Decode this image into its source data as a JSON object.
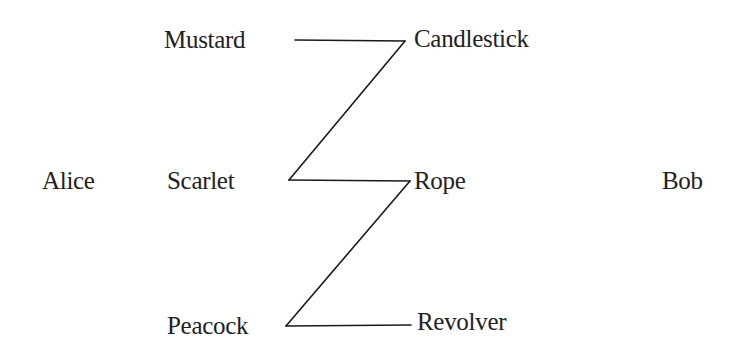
{
  "diagram": {
    "parties": {
      "left": "Alice",
      "right": "Bob"
    },
    "left_column": [
      "Mustard",
      "Scarlet",
      "Peacock"
    ],
    "right_column": [
      "Candlestick",
      "Rope",
      "Revolver"
    ],
    "nodes": [
      {
        "id": "alice",
        "label": "Alice",
        "x": 42,
        "y": 168
      },
      {
        "id": "mustard",
        "label": "Mustard",
        "x": 164,
        "y": 27
      },
      {
        "id": "scarlet",
        "label": "Scarlet",
        "x": 167,
        "y": 168
      },
      {
        "id": "peacock",
        "label": "Peacock",
        "x": 167,
        "y": 313
      },
      {
        "id": "candlestick",
        "label": "Candlestick",
        "x": 414,
        "y": 26
      },
      {
        "id": "rope",
        "label": "Rope",
        "x": 414,
        "y": 168
      },
      {
        "id": "revolver",
        "label": "Revolver",
        "x": 417,
        "y": 309
      },
      {
        "id": "bob",
        "label": "Bob",
        "x": 662,
        "y": 168
      }
    ],
    "edges": [
      {
        "from": "Mustard",
        "to": "Candlestick",
        "x1": 295,
        "y1": 40,
        "x2": 405,
        "y2": 41
      },
      {
        "from": "Candlestick",
        "to": "Scarlet",
        "x1": 405,
        "y1": 41,
        "x2": 289,
        "y2": 180
      },
      {
        "from": "Scarlet",
        "to": "Rope",
        "x1": 289,
        "y1": 180,
        "x2": 410,
        "y2": 181
      },
      {
        "from": "Rope",
        "to": "Peacock",
        "x1": 410,
        "y1": 181,
        "x2": 286,
        "y2": 326
      },
      {
        "from": "Peacock",
        "to": "Revolver",
        "x1": 286,
        "y1": 326,
        "x2": 411,
        "y2": 325
      }
    ],
    "colors": {
      "background": "#ffffff",
      "text": "#222222",
      "line": "#1a1a1a"
    }
  }
}
